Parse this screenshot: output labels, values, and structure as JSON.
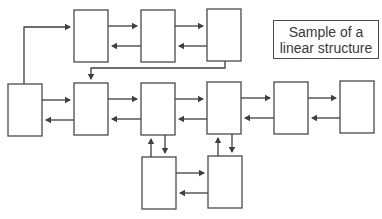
{
  "title_box": {
    "line1": "Sample of a",
    "line2": "linear structure"
  },
  "colors": {
    "stroke": "#4a4a4a",
    "arrow": "#3f3f3f",
    "background": "#ffffff"
  },
  "nodes": [
    {
      "id": "L",
      "row": "middle",
      "x": 8,
      "y": 84,
      "w": 34,
      "h": 52
    },
    {
      "id": "T1",
      "row": "top",
      "x": 74,
      "y": 10,
      "w": 34,
      "h": 52
    },
    {
      "id": "T2",
      "row": "top",
      "x": 141,
      "y": 10,
      "w": 34,
      "h": 52
    },
    {
      "id": "T3",
      "row": "top",
      "x": 207,
      "y": 9,
      "w": 34,
      "h": 52
    },
    {
      "id": "M1",
      "row": "middle",
      "x": 74,
      "y": 83,
      "w": 34,
      "h": 52
    },
    {
      "id": "M2",
      "row": "middle",
      "x": 141,
      "y": 83,
      "w": 34,
      "h": 52
    },
    {
      "id": "M3",
      "row": "middle",
      "x": 207,
      "y": 82,
      "w": 34,
      "h": 52
    },
    {
      "id": "M4",
      "row": "middle",
      "x": 274,
      "y": 82,
      "w": 34,
      "h": 52
    },
    {
      "id": "M5",
      "row": "middle",
      "x": 340,
      "y": 81,
      "w": 34,
      "h": 52
    },
    {
      "id": "B1",
      "row": "bottom",
      "x": 142,
      "y": 157,
      "w": 34,
      "h": 52
    },
    {
      "id": "B2",
      "row": "bottom",
      "x": 208,
      "y": 156,
      "w": 34,
      "h": 52
    }
  ],
  "edges": [
    {
      "from": "L",
      "to": "T1",
      "path": "M24,84 L24,27 L70,27"
    },
    {
      "from": "T1",
      "to": "T2",
      "path": "M108,26 L137,26"
    },
    {
      "from": "T2",
      "to": "T1",
      "path": "M141,46 L112,46"
    },
    {
      "from": "T2",
      "to": "T3",
      "path": "M175,26 L203,26"
    },
    {
      "from": "T3",
      "to": "T2",
      "path": "M207,46 L179,46"
    },
    {
      "from": "T3",
      "to": "M1",
      "path": "M225,61 L225,68 L91,68 L91,79"
    },
    {
      "from": "L",
      "to": "M1",
      "path": "M42,100 L70,100"
    },
    {
      "from": "M1",
      "to": "L",
      "path": "M74,120 L46,120"
    },
    {
      "from": "M1",
      "to": "M2",
      "path": "M108,99 L137,99"
    },
    {
      "from": "M2",
      "to": "M1",
      "path": "M141,119 L112,119"
    },
    {
      "from": "M2",
      "to": "M3",
      "path": "M175,99 L203,99"
    },
    {
      "from": "M3",
      "to": "M2",
      "path": "M207,119 L179,119"
    },
    {
      "from": "M3",
      "to": "M4",
      "path": "M241,98 L270,98"
    },
    {
      "from": "M4",
      "to": "M3",
      "path": "M274,118 L245,118"
    },
    {
      "from": "M4",
      "to": "M5",
      "path": "M308,98 L336,98"
    },
    {
      "from": "M5",
      "to": "M4",
      "path": "M340,118 L312,118"
    },
    {
      "from": "B1",
      "to": "M2",
      "path": "M151,157 L151,139"
    },
    {
      "from": "M2",
      "to": "B1",
      "path": "M165,135 L165,153"
    },
    {
      "from": "B2",
      "to": "M3",
      "path": "M218,156 L218,138"
    },
    {
      "from": "M3",
      "to": "B2",
      "path": "M232,134 L232,152"
    },
    {
      "from": "B1",
      "to": "B2",
      "path": "M176,173 L204,173"
    },
    {
      "from": "B2",
      "to": "B1",
      "path": "M208,193 L180,193"
    }
  ]
}
